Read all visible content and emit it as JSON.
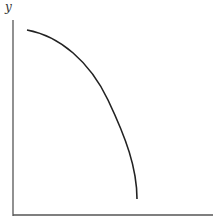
{
  "diagram": {
    "y_axis_label": "y",
    "x_axis_label": "",
    "colors": {
      "axis": "#555555",
      "curve": "#222222",
      "background": "#ffffff"
    },
    "curve_path": "M27,30 C60,36 90,62 108,100 C126,138 137,168 137,199",
    "axes": {
      "y_axis": {
        "x": 13,
        "y1": 20,
        "y2": 216
      },
      "x_axis": {
        "y": 215,
        "x1": 13,
        "x2": 213
      }
    }
  },
  "chart_data": {
    "type": "line",
    "title": "",
    "xlabel": "",
    "ylabel": "y",
    "x": [
      27,
      50,
      70,
      90,
      105,
      118,
      128,
      134,
      137
    ],
    "y": [
      30,
      38,
      52,
      72,
      96,
      122,
      150,
      175,
      199
    ],
    "grid": false,
    "legend": null
  }
}
